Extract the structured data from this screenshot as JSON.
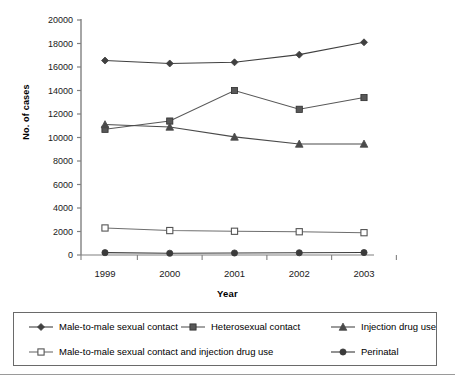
{
  "chart_data": {
    "type": "line",
    "title": "",
    "xlabel": "Year",
    "ylabel": "No. of cases",
    "categories": [
      "1999",
      "2000",
      "2001",
      "2002",
      "2003"
    ],
    "x": [
      1999,
      2000,
      2001,
      2002,
      2003
    ],
    "ylim": [
      0,
      20000
    ],
    "yticks": [
      0,
      2000,
      4000,
      6000,
      8000,
      10000,
      12000,
      14000,
      16000,
      18000,
      20000
    ],
    "ytick_labels": [
      "0",
      "2000",
      "4000",
      "6000",
      "8000",
      "10000",
      "12000",
      "14000",
      "16000",
      "18000",
      "20000"
    ],
    "grid": false,
    "legend_position": "bottom",
    "series": [
      {
        "name": "Male-to-male sexual contact",
        "marker": "filled-diamond",
        "color": "#404040",
        "values": [
          16550,
          16300,
          16400,
          17050,
          18100
        ]
      },
      {
        "name": "Heterosexual contact",
        "marker": "filled-square",
        "color": "#585858",
        "values": [
          10700,
          11400,
          14000,
          12400,
          13400
        ]
      },
      {
        "name": "Injection drug use",
        "marker": "filled-triangle",
        "color": "#4a4a4a",
        "values": [
          11100,
          10900,
          10050,
          9450,
          9450
        ]
      },
      {
        "name": "Male-to-male sexual contact and injection drug use",
        "marker": "open-square",
        "color": "#6e6e6e",
        "values": [
          2300,
          2080,
          2020,
          1980,
          1900
        ]
      },
      {
        "name": "Perinatal",
        "marker": "filled-circle",
        "color": "#3a3a3a",
        "values": [
          200,
          150,
          170,
          190,
          210
        ]
      }
    ]
  },
  "legend": {
    "entries": [
      {
        "label": "Male-to-male sexual contact",
        "marker": "filled-diamond"
      },
      {
        "label": "Heterosexual contact",
        "marker": "filled-square"
      },
      {
        "label": "Injection drug use",
        "marker": "filled-triangle"
      },
      {
        "label": "Male-to-male sexual contact and injection drug use",
        "marker": "open-square"
      },
      {
        "label": "Perinatal",
        "marker": "filled-circle"
      }
    ]
  },
  "axes": {
    "y_title": "No. of cases",
    "x_title": "Year"
  }
}
